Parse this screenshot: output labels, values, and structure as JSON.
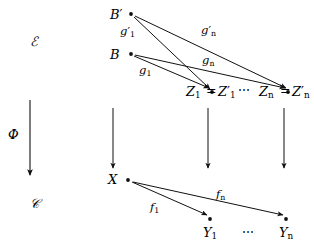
{
  "diagram": {
    "stroke_color": "#111111",
    "background_color": "#ffffff",
    "categories": [
      {
        "id": "cat-E",
        "label": "ℰ",
        "x": 30,
        "y": 35
      },
      {
        "id": "cat-C",
        "label": "𝒞",
        "x": 30,
        "y": 197
      }
    ],
    "functor": {
      "id": "functor-phi",
      "label": "Φ",
      "x": 8,
      "y": 128,
      "arrow": {
        "x": 30,
        "y1": 100,
        "y2": 175
      }
    },
    "nodes": [
      {
        "id": "node-B-prime",
        "label": "B",
        "prime": true,
        "sub": "",
        "lx": 110,
        "ly": 8,
        "dx": 131,
        "dy": 14
      },
      {
        "id": "node-B",
        "label": "B",
        "prime": false,
        "sub": "",
        "lx": 110,
        "ly": 48,
        "dx": 131,
        "dy": 54
      },
      {
        "id": "node-Z1",
        "label": "Z",
        "prime": false,
        "sub": "1",
        "lx": 186,
        "ly": 92,
        "dx": 212,
        "dy": 92
      },
      {
        "id": "node-Z1-prime",
        "label": "Z",
        "prime": true,
        "sub": "1",
        "lx": 223,
        "ly": 92,
        "dx": 212,
        "dy": 92
      },
      {
        "id": "node-Zn",
        "label": "Z",
        "prime": false,
        "sub": "n",
        "lx": 258,
        "ly": 92,
        "dx": 288,
        "dy": 92
      },
      {
        "id": "node-Zn-prime",
        "label": "Z",
        "prime": true,
        "sub": "n",
        "lx": 296,
        "ly": 92,
        "dx": 288,
        "dy": 92
      },
      {
        "id": "node-X",
        "label": "X",
        "prime": false,
        "sub": "",
        "lx": 108,
        "ly": 173,
        "dx": 128,
        "dy": 180
      },
      {
        "id": "node-Y1",
        "label": "Y",
        "prime": false,
        "sub": "1",
        "lx": 203,
        "ly": 228,
        "dx": 210,
        "dy": 219
      },
      {
        "id": "node-Yn",
        "label": "Y",
        "prime": false,
        "sub": "n",
        "lx": 279,
        "ly": 228,
        "dx": 286,
        "dy": 219
      }
    ],
    "equalities": [
      {
        "id": "equals-Z1",
        "label": "=",
        "x": 210,
        "y": 92
      },
      {
        "id": "equals-Zn",
        "label": "=",
        "x": 284,
        "y": 92
      }
    ],
    "ellipses": [
      {
        "id": "ellipsis-Z",
        "label": "⋯",
        "x": 238,
        "y": 90
      },
      {
        "id": "ellipsis-Y",
        "label": "⋯",
        "x": 245,
        "y": 226
      }
    ],
    "morphisms": [
      {
        "id": "morph-g1-prime",
        "label": "g",
        "prime": true,
        "sub": "1",
        "lx": 120,
        "ly": 29,
        "x1": 134,
        "y1": 17,
        "x2": 210,
        "y2": 89
      },
      {
        "id": "morph-gn-prime",
        "label": "g",
        "prime": true,
        "sub": "n",
        "lx": 200,
        "ly": 28,
        "x1": 135,
        "y1": 16,
        "x2": 286,
        "y2": 88
      },
      {
        "id": "morph-g1",
        "label": "g",
        "prime": false,
        "sub": "1",
        "lx": 139,
        "ly": 67,
        "x1": 134,
        "y1": 56,
        "x2": 210,
        "y2": 88
      },
      {
        "id": "morph-gn",
        "label": "g",
        "prime": false,
        "sub": "n",
        "lx": 201,
        "ly": 57,
        "x1": 135,
        "y1": 55,
        "x2": 286,
        "y2": 88
      },
      {
        "id": "morph-f1",
        "label": "f",
        "prime": false,
        "sub": "1",
        "lx": 150,
        "ly": 204,
        "x1": 132,
        "y1": 182,
        "x2": 208,
        "y2": 216
      },
      {
        "id": "morph-fn",
        "label": "f",
        "prime": false,
        "sub": "n",
        "lx": 215,
        "ly": 191,
        "x1": 133,
        "y1": 182,
        "x2": 284,
        "y2": 216
      }
    ],
    "vertical_arrows": [
      {
        "id": "varrow-X",
        "x": 113,
        "y1": 108,
        "y2": 168
      },
      {
        "id": "varrow-Z1",
        "x": 208,
        "y1": 108,
        "y2": 168
      },
      {
        "id": "varrow-Zn",
        "x": 284,
        "y1": 108,
        "y2": 168
      }
    ]
  }
}
